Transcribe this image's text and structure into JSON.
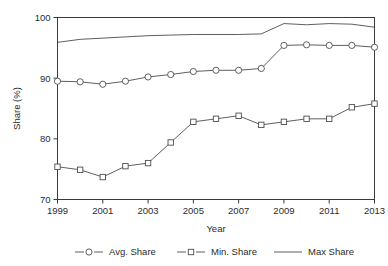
{
  "chart_data": {
    "type": "line",
    "title": "",
    "xlabel": "Year",
    "ylabel": "Share (%)",
    "xlim": [
      1999,
      2013
    ],
    "ylim": [
      70,
      100
    ],
    "xticks": [
      1999,
      2001,
      2003,
      2005,
      2007,
      2009,
      2011,
      2013
    ],
    "xtick_labels": [
      "1999",
      "2001",
      "2003",
      "2005",
      "2007",
      "2009",
      "2011",
      "2013"
    ],
    "yticks": [
      70,
      80,
      90,
      100
    ],
    "ytick_labels": [
      "70",
      "80",
      "90",
      "100"
    ],
    "grid": false,
    "legend_position": "bottom",
    "x": [
      1999,
      2000,
      2001,
      2002,
      2003,
      2004,
      2005,
      2006,
      2007,
      2008,
      2009,
      2010,
      2011,
      2012,
      2013
    ],
    "series": [
      {
        "name": "Avg. Share",
        "marker": "circle",
        "values": [
          89.5,
          89.4,
          89.0,
          89.5,
          90.2,
          90.6,
          91.1,
          91.3,
          91.3,
          91.6,
          95.4,
          95.5,
          95.4,
          95.4,
          95.1
        ]
      },
      {
        "name": "Min. Share",
        "marker": "square",
        "values": [
          75.4,
          74.9,
          73.7,
          75.5,
          76.0,
          79.4,
          82.8,
          83.3,
          83.8,
          82.3,
          82.8,
          83.3,
          83.3,
          85.2,
          85.8
        ]
      },
      {
        "name": "Max Share",
        "marker": "none",
        "values": [
          95.9,
          96.4,
          96.6,
          96.8,
          97.0,
          97.1,
          97.2,
          97.2,
          97.2,
          97.3,
          99.0,
          98.8,
          99.0,
          98.9,
          98.4
        ]
      }
    ],
    "colors": {
      "line": "#4d4d4d",
      "axis": "#3a3a3a",
      "text": "#2b2b2b",
      "background": "#ffffff",
      "marker_fill": "#ffffff"
    },
    "legend": [
      {
        "label": "Avg. Share",
        "marker": "circle"
      },
      {
        "label": "Min. Share",
        "marker": "square"
      },
      {
        "label": "Max Share",
        "marker": "none"
      }
    ]
  }
}
